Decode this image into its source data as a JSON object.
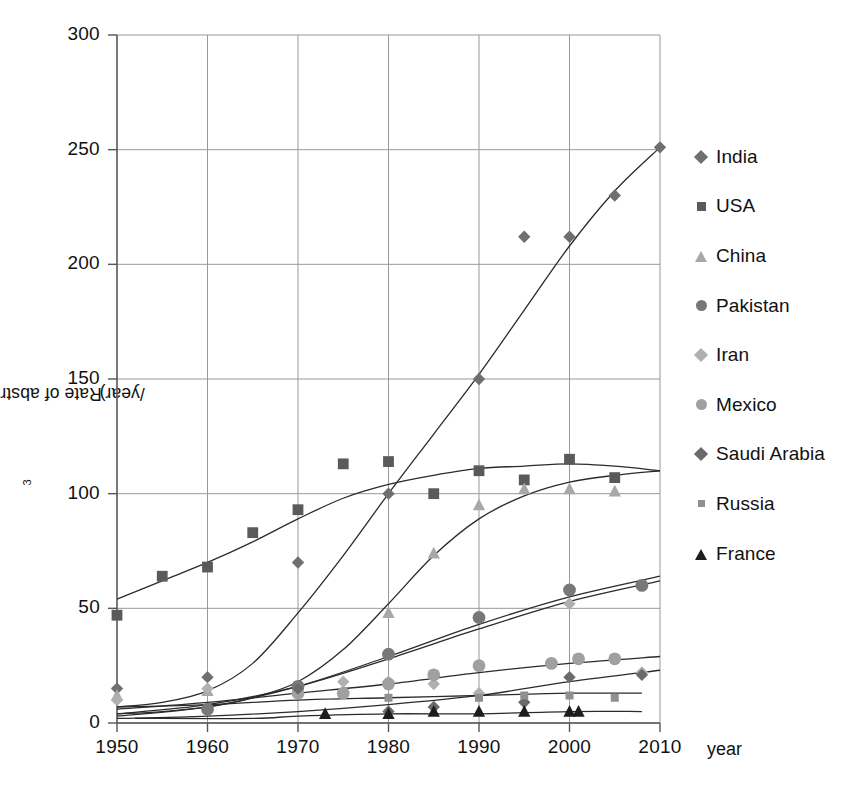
{
  "chart_data": {
    "type": "line",
    "title": "",
    "xlabel": "year",
    "ylabel_text": "Rate of abstraction (km",
    "ylabel_sup": "3",
    "ylabel_tail": "/year)",
    "ylabel_full": "Rate of abstraction (km3/year)",
    "xlim": [
      1950,
      2010
    ],
    "ylim": [
      0,
      300
    ],
    "x_ticks": [
      "1950",
      "1960",
      "1970",
      "1980",
      "1990",
      "2000",
      "2010"
    ],
    "y_ticks": [
      "0",
      "50",
      "100",
      "150",
      "200",
      "250",
      "300"
    ],
    "grid": true,
    "legend_position": "right",
    "series": [
      {
        "name": "India",
        "marker": "diamond",
        "color": "#6f6f6f",
        "points": [
          {
            "x": 1950,
            "y": 15
          },
          {
            "x": 1960,
            "y": 20
          },
          {
            "x": 1970,
            "y": 70
          },
          {
            "x": 1980,
            "y": 100
          },
          {
            "x": 1990,
            "y": 150
          },
          {
            "x": 1995,
            "y": 212
          },
          {
            "x": 2000,
            "y": 212
          },
          {
            "x": 2005,
            "y": 230
          },
          {
            "x": 2010,
            "y": 251
          }
        ],
        "trend": [
          {
            "x": 1950,
            "y": 7
          },
          {
            "x": 1955,
            "y": 9
          },
          {
            "x": 1960,
            "y": 14
          },
          {
            "x": 1965,
            "y": 26
          },
          {
            "x": 1970,
            "y": 48
          },
          {
            "x": 1975,
            "y": 73
          },
          {
            "x": 1980,
            "y": 100
          },
          {
            "x": 1985,
            "y": 126
          },
          {
            "x": 1990,
            "y": 152
          },
          {
            "x": 1995,
            "y": 180
          },
          {
            "x": 2000,
            "y": 208
          },
          {
            "x": 2005,
            "y": 232
          },
          {
            "x": 2010,
            "y": 251
          }
        ]
      },
      {
        "name": "USA",
        "marker": "square",
        "color": "#5a5a5a",
        "points": [
          {
            "x": 1950,
            "y": 47
          },
          {
            "x": 1955,
            "y": 64
          },
          {
            "x": 1960,
            "y": 68
          },
          {
            "x": 1965,
            "y": 83
          },
          {
            "x": 1970,
            "y": 93
          },
          {
            "x": 1975,
            "y": 113
          },
          {
            "x": 1980,
            "y": 114
          },
          {
            "x": 1985,
            "y": 100
          },
          {
            "x": 1990,
            "y": 110
          },
          {
            "x": 1995,
            "y": 106
          },
          {
            "x": 2000,
            "y": 115
          },
          {
            "x": 2005,
            "y": 107
          }
        ],
        "trend": [
          {
            "x": 1950,
            "y": 54
          },
          {
            "x": 1955,
            "y": 62
          },
          {
            "x": 1960,
            "y": 70
          },
          {
            "x": 1965,
            "y": 79
          },
          {
            "x": 1970,
            "y": 89
          },
          {
            "x": 1975,
            "y": 98
          },
          {
            "x": 1980,
            "y": 104
          },
          {
            "x": 1985,
            "y": 108
          },
          {
            "x": 1990,
            "y": 111
          },
          {
            "x": 1995,
            "y": 112
          },
          {
            "x": 2000,
            "y": 113
          },
          {
            "x": 2005,
            "y": 112
          },
          {
            "x": 2010,
            "y": 110
          }
        ]
      },
      {
        "name": "China",
        "marker": "triangle",
        "color": "#a8a8a8",
        "points": [
          {
            "x": 1950,
            "y": 12
          },
          {
            "x": 1960,
            "y": 14
          },
          {
            "x": 1970,
            "y": 16
          },
          {
            "x": 1980,
            "y": 48
          },
          {
            "x": 1985,
            "y": 74
          },
          {
            "x": 1990,
            "y": 95
          },
          {
            "x": 1995,
            "y": 102
          },
          {
            "x": 2000,
            "y": 102
          },
          {
            "x": 2005,
            "y": 101
          }
        ],
        "trend": [
          {
            "x": 1950,
            "y": 4
          },
          {
            "x": 1955,
            "y": 5
          },
          {
            "x": 1960,
            "y": 7
          },
          {
            "x": 1965,
            "y": 11
          },
          {
            "x": 1970,
            "y": 18
          },
          {
            "x": 1975,
            "y": 32
          },
          {
            "x": 1980,
            "y": 52
          },
          {
            "x": 1985,
            "y": 73
          },
          {
            "x": 1990,
            "y": 89
          },
          {
            "x": 1995,
            "y": 99
          },
          {
            "x": 2000,
            "y": 105
          },
          {
            "x": 2005,
            "y": 108
          },
          {
            "x": 2010,
            "y": 110
          }
        ]
      },
      {
        "name": "Pakistan",
        "marker": "circle",
        "color": "#787878",
        "points": [
          {
            "x": 1960,
            "y": 6
          },
          {
            "x": 1970,
            "y": 16
          },
          {
            "x": 1980,
            "y": 30
          },
          {
            "x": 1990,
            "y": 46
          },
          {
            "x": 2000,
            "y": 58
          },
          {
            "x": 2008,
            "y": 60
          }
        ],
        "trend": [
          {
            "x": 1950,
            "y": 3
          },
          {
            "x": 1960,
            "y": 7
          },
          {
            "x": 1970,
            "y": 16
          },
          {
            "x": 1980,
            "y": 29
          },
          {
            "x": 1990,
            "y": 43
          },
          {
            "x": 2000,
            "y": 55
          },
          {
            "x": 2010,
            "y": 64
          }
        ]
      },
      {
        "name": "Iran",
        "marker": "diamond",
        "color": "#b0b0b0",
        "points": [
          {
            "x": 1950,
            "y": 10
          },
          {
            "x": 1960,
            "y": 15
          },
          {
            "x": 1970,
            "y": 15
          },
          {
            "x": 1975,
            "y": 18
          },
          {
            "x": 1980,
            "y": 18
          },
          {
            "x": 1985,
            "y": 17
          },
          {
            "x": 1990,
            "y": 13
          },
          {
            "x": 2000,
            "y": 52
          },
          {
            "x": 2008,
            "y": 22
          }
        ],
        "trend": [
          {
            "x": 1950,
            "y": 4
          },
          {
            "x": 1960,
            "y": 8
          },
          {
            "x": 1970,
            "y": 16
          },
          {
            "x": 1980,
            "y": 28
          },
          {
            "x": 1990,
            "y": 41
          },
          {
            "x": 2000,
            "y": 53
          },
          {
            "x": 2010,
            "y": 62
          }
        ]
      },
      {
        "name": "Mexico",
        "marker": "circle",
        "color": "#a0a0a0",
        "points": [
          {
            "x": 1970,
            "y": 13
          },
          {
            "x": 1975,
            "y": 13
          },
          {
            "x": 1980,
            "y": 17
          },
          {
            "x": 1985,
            "y": 21
          },
          {
            "x": 1990,
            "y": 25
          },
          {
            "x": 1998,
            "y": 26
          },
          {
            "x": 2001,
            "y": 28
          },
          {
            "x": 2005,
            "y": 28
          }
        ],
        "trend": [
          {
            "x": 1950,
            "y": 6
          },
          {
            "x": 1960,
            "y": 9
          },
          {
            "x": 1970,
            "y": 13
          },
          {
            "x": 1980,
            "y": 17
          },
          {
            "x": 1990,
            "y": 22
          },
          {
            "x": 2000,
            "y": 26
          },
          {
            "x": 2010,
            "y": 29
          }
        ]
      },
      {
        "name": "Saudi Arabia",
        "marker": "diamond",
        "color": "#6a6a6a",
        "points": [
          {
            "x": 1970,
            "y": 15
          },
          {
            "x": 1980,
            "y": 5
          },
          {
            "x": 1985,
            "y": 7
          },
          {
            "x": 1995,
            "y": 9
          },
          {
            "x": 2000,
            "y": 20
          },
          {
            "x": 2008,
            "y": 21
          }
        ],
        "trend": [
          {
            "x": 1950,
            "y": 2
          },
          {
            "x": 1960,
            "y": 3
          },
          {
            "x": 1970,
            "y": 5
          },
          {
            "x": 1980,
            "y": 8
          },
          {
            "x": 1990,
            "y": 12
          },
          {
            "x": 2000,
            "y": 18
          },
          {
            "x": 2010,
            "y": 23
          }
        ]
      },
      {
        "name": "Russia",
        "marker": "square-sm",
        "color": "#909090",
        "points": [
          {
            "x": 1980,
            "y": 11
          },
          {
            "x": 1990,
            "y": 11
          },
          {
            "x": 1995,
            "y": 12
          },
          {
            "x": 2000,
            "y": 12
          },
          {
            "x": 2005,
            "y": 11
          }
        ],
        "trend": [
          {
            "x": 1950,
            "y": 7
          },
          {
            "x": 1960,
            "y": 8
          },
          {
            "x": 1970,
            "y": 10
          },
          {
            "x": 1980,
            "y": 11
          },
          {
            "x": 1990,
            "y": 12
          },
          {
            "x": 2000,
            "y": 13
          },
          {
            "x": 2008,
            "y": 13
          }
        ]
      },
      {
        "name": "France",
        "marker": "triangle",
        "color": "#1d1d1d",
        "points": [
          {
            "x": 1973,
            "y": 4
          },
          {
            "x": 1980,
            "y": 4
          },
          {
            "x": 1985,
            "y": 5
          },
          {
            "x": 1990,
            "y": 5
          },
          {
            "x": 1995,
            "y": 5
          },
          {
            "x": 2000,
            "y": 5
          },
          {
            "x": 2001,
            "y": 5
          }
        ],
        "trend": [
          {
            "x": 1952,
            "y": 2
          },
          {
            "x": 1965,
            "y": 2
          },
          {
            "x": 1970,
            "y": 3
          },
          {
            "x": 1980,
            "y": 4
          },
          {
            "x": 1990,
            "y": 4
          },
          {
            "x": 2000,
            "y": 5
          },
          {
            "x": 2008,
            "y": 5
          }
        ]
      }
    ]
  },
  "legend": {
    "items": [
      {
        "label": "India",
        "marker": "diamond",
        "color": "#6f6f6f"
      },
      {
        "label": "USA",
        "marker": "square",
        "color": "#5a5a5a"
      },
      {
        "label": "China",
        "marker": "triangle",
        "color": "#a8a8a8"
      },
      {
        "label": "Pakistan",
        "marker": "circle",
        "color": "#787878"
      },
      {
        "label": "Iran",
        "marker": "diamond",
        "color": "#b0b0b0"
      },
      {
        "label": "Mexico",
        "marker": "circle",
        "color": "#a0a0a0"
      },
      {
        "label": "Saudi Arabia",
        "marker": "diamond",
        "color": "#6a6a6a"
      },
      {
        "label": "Russia",
        "marker": "square-sm",
        "color": "#909090"
      },
      {
        "label": "France",
        "marker": "triangle",
        "color": "#1d1d1d"
      }
    ]
  },
  "style": {
    "grid_color": "#999999",
    "axis_color": "#555555",
    "curve_color": "#2b2b2b",
    "text_color": "#111111"
  }
}
